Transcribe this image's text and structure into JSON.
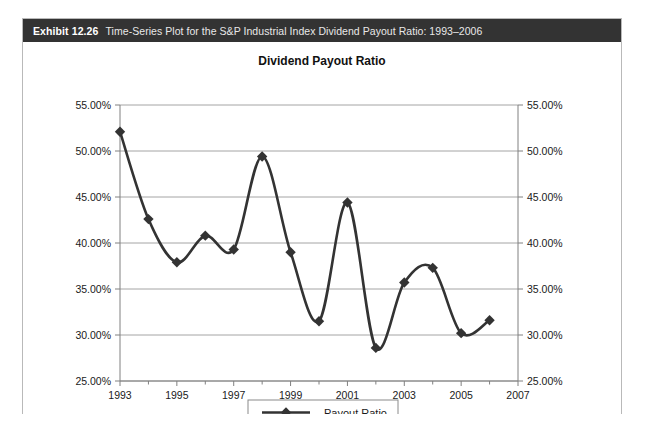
{
  "exhibit": {
    "label": "Exhibit 12.26",
    "caption": "Time-Series Plot for the S&P Industrial Index Dividend Payout Ratio: 1993–2006"
  },
  "legend": {
    "entries": [
      {
        "name": "payout-ratio",
        "label": "Payout Ratio",
        "marker": "diamond",
        "color": "#333333"
      }
    ],
    "position": "bottom-center"
  },
  "colors": {
    "header_bg": "#333333",
    "header_text": "#ffffff",
    "panel_border": "#b9b9b9",
    "series": "#333333",
    "gridline": "#9a9a9a",
    "axis": "#808080"
  },
  "chart_data": {
    "type": "line",
    "title": "Dividend Payout Ratio",
    "xlabel": "",
    "ylabel": "",
    "grid": true,
    "legend_position": "bottom-center",
    "xlim": [
      1993,
      2007
    ],
    "ylim": [
      25,
      55
    ],
    "x_ticks_major": [
      1993,
      1995,
      1997,
      1999,
      2001,
      2003,
      2005,
      2007
    ],
    "x_ticks_minor": [
      1994,
      1996,
      1998,
      2000,
      2002,
      2004,
      2006
    ],
    "x_tick_labels": [
      "1993",
      "1995",
      "1997",
      "1999",
      "2001",
      "2003",
      "2005",
      "2007"
    ],
    "y_ticks": [
      25,
      30,
      35,
      40,
      45,
      50,
      55
    ],
    "y_tick_labels": [
      "25.00%",
      "30.00%",
      "35.00%",
      "40.00%",
      "45.00%",
      "50.00%",
      "55.00%"
    ],
    "y_axis_right": true,
    "y_tick_labels_right": [
      "25.00%",
      "30.00%",
      "35.00%",
      "40.00%",
      "45.00%",
      "50.00%",
      "55.00%"
    ],
    "x": [
      1993,
      1994,
      1995,
      1996,
      1997,
      1998,
      1999,
      2000,
      2001,
      2002,
      2003,
      2004,
      2005,
      2006
    ],
    "series": [
      {
        "name": "Payout Ratio",
        "marker": "diamond",
        "color": "#333333",
        "values": [
          52.1,
          42.6,
          37.9,
          40.8,
          39.3,
          49.4,
          39.0,
          31.5,
          44.4,
          28.6,
          35.7,
          37.3,
          30.2,
          31.6
        ]
      }
    ]
  }
}
